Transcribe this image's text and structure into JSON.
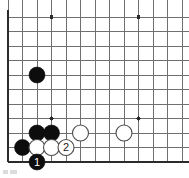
{
  "board": {
    "title": "Go board diagram",
    "corner": "bottom-left",
    "geometry": {
      "origin_x": 8,
      "origin_y": 17,
      "step": 14.5,
      "cols": 13,
      "rows": 11,
      "stone_radius": 8.0,
      "edge_left_x": 8,
      "edge_bottom_y": 162
    },
    "colors": {
      "background": "#ffffff",
      "grid_line": "#6f6f6f",
      "edge_line": "#2b2b2b",
      "black_stone": "#0d0d0d",
      "white_stone_fill": "#ffffff",
      "white_stone_stroke": "#4a4a4a",
      "black_label_text": "#ffffff",
      "white_label_text": "#1a1a1a"
    },
    "edges": [
      {
        "name": "left-edge",
        "orientation": "vertical",
        "x": 8,
        "y1": 10,
        "y2": 162,
        "width": 2.6
      },
      {
        "name": "bottom-edge",
        "orientation": "horizontal",
        "y": 162,
        "x1": 8,
        "x2": 189,
        "width": 2.6
      }
    ],
    "star_points": [
      {
        "col": 3,
        "row": 0,
        "x": 51.5,
        "y": 17
      },
      {
        "col": 9,
        "row": 0,
        "x": 138.5,
        "y": 17
      },
      {
        "col": 3,
        "row": 7,
        "x": 51.5,
        "y": 118.5
      },
      {
        "col": 9,
        "row": 7,
        "x": 138.5,
        "y": 118.5
      }
    ],
    "star_point_radius": 2.1,
    "stones": [
      {
        "id": "b-lone",
        "color": "black",
        "col": 2,
        "row": 4,
        "x": 37,
        "y": 75,
        "label": ""
      },
      {
        "id": "b-c2r8",
        "color": "black",
        "col": 2,
        "row": 8,
        "x": 37,
        "y": 133,
        "label": ""
      },
      {
        "id": "b-c3r8",
        "color": "black",
        "col": 3,
        "row": 8,
        "x": 51.5,
        "y": 133,
        "label": ""
      },
      {
        "id": "w-c5r8",
        "color": "white",
        "col": 5,
        "row": 8,
        "x": 80.5,
        "y": 133,
        "label": ""
      },
      {
        "id": "w-c8r8",
        "color": "white",
        "col": 8,
        "row": 8,
        "x": 124,
        "y": 133,
        "label": ""
      },
      {
        "id": "b-c1r9",
        "color": "black",
        "col": 1,
        "row": 9,
        "x": 22.5,
        "y": 147.5,
        "label": ""
      },
      {
        "id": "w-c2r9",
        "color": "white",
        "col": 2,
        "row": 9,
        "x": 37,
        "y": 147.5,
        "label": ""
      },
      {
        "id": "w-c3r9",
        "color": "white",
        "col": 3,
        "row": 9,
        "x": 51.5,
        "y": 147.5,
        "label": ""
      },
      {
        "id": "w-move2",
        "color": "white",
        "col": 4,
        "row": 9,
        "x": 66,
        "y": 147.5,
        "label": "2"
      },
      {
        "id": "b-move1",
        "color": "black",
        "col": 2,
        "row": 10,
        "x": 37,
        "y": 162,
        "label": "1"
      }
    ],
    "move_labels": [
      {
        "number": "1",
        "color": "black",
        "text_color": "#ffffff"
      },
      {
        "number": "2",
        "color": "white",
        "text_color": "#1a1a1a"
      }
    ],
    "caption": ""
  }
}
